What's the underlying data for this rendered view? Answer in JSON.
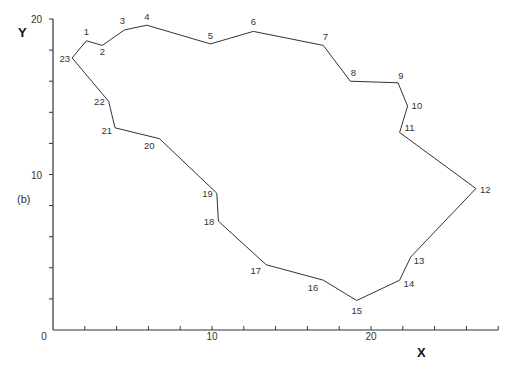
{
  "figure": {
    "panel_label": "(b)",
    "x_axis_title": "X",
    "y_axis_title": "Y",
    "x_tick_labels": [
      {
        "value": 0,
        "label": "0"
      },
      {
        "value": 10,
        "label": "10"
      },
      {
        "value": 20,
        "label": "20"
      }
    ],
    "y_tick_labels": [
      {
        "value": 10,
        "label": "10"
      },
      {
        "value": 20,
        "label": "20"
      }
    ],
    "line_color": "#333333"
  },
  "chart_data": {
    "type": "line",
    "title": "",
    "xlabel": "X",
    "ylabel": "Y",
    "xlim": [
      0,
      28
    ],
    "ylim": [
      0,
      20
    ],
    "x_ticks_every": 2,
    "y_ticks_every": 2,
    "grid": false,
    "closed_polygon": true,
    "series": [
      {
        "name": "boundary",
        "points": [
          {
            "id": "1",
            "x": 2.1,
            "y": 18.6
          },
          {
            "id": "2",
            "x": 3.1,
            "y": 18.3
          },
          {
            "id": "3",
            "x": 4.5,
            "y": 19.3
          },
          {
            "id": "4",
            "x": 5.9,
            "y": 19.6
          },
          {
            "id": "5",
            "x": 9.9,
            "y": 18.4
          },
          {
            "id": "6",
            "x": 12.6,
            "y": 19.2
          },
          {
            "id": "7",
            "x": 17.0,
            "y": 18.3
          },
          {
            "id": "8",
            "x": 18.7,
            "y": 16.0
          },
          {
            "id": "9",
            "x": 21.7,
            "y": 15.9
          },
          {
            "id": "10",
            "x": 22.3,
            "y": 14.4
          },
          {
            "id": "11",
            "x": 21.8,
            "y": 12.7
          },
          {
            "id": "12",
            "x": 26.6,
            "y": 9.1
          },
          {
            "id": "13",
            "x": 22.5,
            "y": 4.7
          },
          {
            "id": "14",
            "x": 21.8,
            "y": 3.2
          },
          {
            "id": "15",
            "x": 19.1,
            "y": 1.9
          },
          {
            "id": "16",
            "x": 17.0,
            "y": 3.2
          },
          {
            "id": "17",
            "x": 13.4,
            "y": 4.2
          },
          {
            "id": "18",
            "x": 10.4,
            "y": 7.0
          },
          {
            "id": "19",
            "x": 10.3,
            "y": 8.8
          },
          {
            "id": "20",
            "x": 6.7,
            "y": 12.3
          },
          {
            "id": "21",
            "x": 3.9,
            "y": 13.0
          },
          {
            "id": "22",
            "x": 3.5,
            "y": 14.7
          },
          {
            "id": "23",
            "x": 1.2,
            "y": 17.5
          }
        ]
      }
    ]
  }
}
